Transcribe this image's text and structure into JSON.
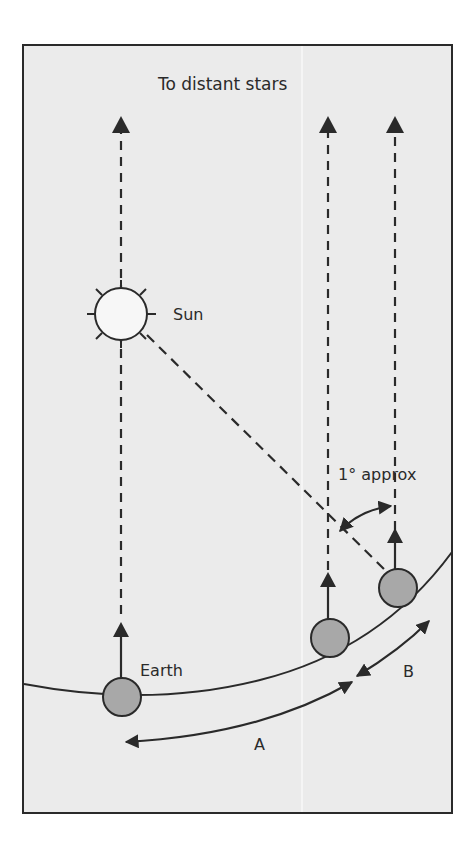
{
  "diagram": {
    "title": "To distant stars",
    "labels": {
      "sun": "Sun",
      "earth": "Earth",
      "angle": "1° approx",
      "arc_a": "A",
      "arc_b": "B"
    },
    "colors": {
      "page": "#ffffff",
      "panel": "#ebebeb",
      "ink": "#2a2a2a",
      "sun_fill": "#f7f7f7",
      "earth_fill": "#a8a8a8",
      "crease": "#f8f8f8"
    },
    "elements": {
      "sun": "sun-icon",
      "earth_positions": [
        "earth-position-1",
        "earth-position-2",
        "earth-position-3"
      ],
      "arrows": [
        "star-direction-arrow-1",
        "star-direction-arrow-2",
        "star-direction-arrow-3",
        "sun-line",
        "arc-a-arrow",
        "arc-b-arrow",
        "angle-arrow"
      ]
    }
  }
}
